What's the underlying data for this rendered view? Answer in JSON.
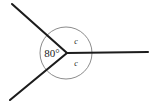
{
  "figure": {
    "kind": "angles-at-a-point-diagram",
    "background_color": "#ffffff",
    "line_color": "#1c1c1c",
    "circle_color": "#6d6d6d",
    "text_color": "#1a1a1a",
    "vertex": {
      "x": 67,
      "y": 53
    },
    "circle": {
      "cx": 66,
      "cy": 53,
      "r": 26
    },
    "rays": [
      {
        "name": "upper-left-ray",
        "x1": 67,
        "y1": 53,
        "x2": 12,
        "y2": 4
      },
      {
        "name": "lower-left-ray",
        "x1": 67,
        "y1": 53,
        "x2": 10,
        "y2": 100
      },
      {
        "name": "right-horizontal-ray",
        "x1": 67,
        "y1": 53,
        "x2": 148,
        "y2": 52
      }
    ],
    "labels": {
      "known_angle": {
        "text": "80°",
        "x": 52,
        "y": 57,
        "sector": "left"
      },
      "unknown_angle_upper": {
        "text": "c",
        "x": 76,
        "y": 44,
        "sector": "upper-right"
      },
      "unknown_angle_lower": {
        "text": "c",
        "x": 76,
        "y": 66,
        "sector": "lower-right"
      }
    }
  },
  "chart_data": {
    "type": "diagram",
    "title": "",
    "angles": [
      {
        "label": "80°",
        "value": 80,
        "known": true,
        "between": [
          "upper-left-ray",
          "lower-left-ray"
        ]
      },
      {
        "label": "c",
        "value": null,
        "known": false,
        "between": [
          "upper-left-ray",
          "right-horizontal-ray"
        ]
      },
      {
        "label": "c",
        "value": null,
        "known": false,
        "between": [
          "right-horizontal-ray",
          "lower-left-ray"
        ]
      }
    ],
    "total_degrees_about_point": 360
  }
}
